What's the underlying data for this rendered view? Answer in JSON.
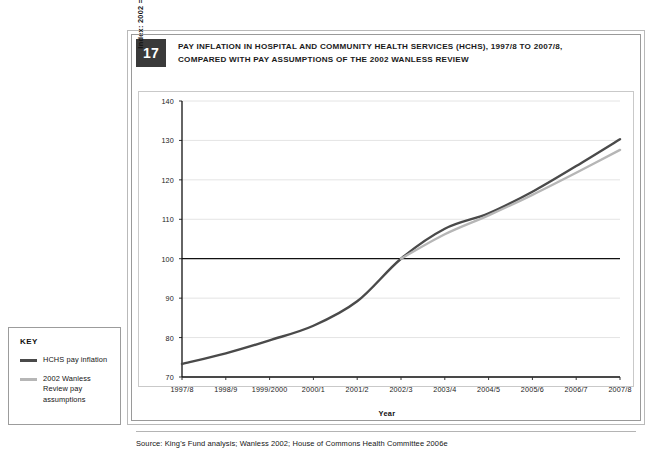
{
  "figure": {
    "number": "17",
    "title": "PAY INFLATION IN HOSPITAL AND COMMUNITY HEALTH SERVICES (HCHS), 1997/8 TO 2007/8, COMPARED WITH PAY ASSUMPTIONS OF THE 2002 WANLESS REVIEW",
    "source": "Source: King's Fund analysis; Wanless 2002; House of Commons Health Committee 2006e"
  },
  "key": {
    "heading": "KEY",
    "entries": [
      {
        "label": "HCHS pay inflation",
        "color": "#4a4a4a"
      },
      {
        "label": "2002 Wanless Review pay assumptions",
        "color": "#b6b6b6"
      }
    ]
  },
  "colors": {
    "series_hchs": "#4a4a4a",
    "series_wanless": "#b6b6b6",
    "gridline": "#e4e4e4",
    "baseline": "#111111",
    "frame": "#c9c9c9",
    "badge_bg": "#3a3a3a"
  },
  "chart_data": {
    "type": "line",
    "title": "PAY INFLATION IN HOSPITAL AND COMMUNITY HEALTH SERVICES (HCHS), 1997/8 TO 2007/8, COMPARED WITH PAY ASSUMPTIONS OF THE 2002 WANLESS REVIEW",
    "xlabel": "Year",
    "ylabel": "Index: 2002 = 100",
    "ylim": [
      70,
      140
    ],
    "yticks": [
      70,
      80,
      90,
      100,
      110,
      120,
      130,
      140
    ],
    "grid": true,
    "emphasized_gridline": 100,
    "legend_position": "outside-left",
    "categories": [
      "1997/8",
      "1998/9",
      "1999/2000",
      "2000/1",
      "2001/2",
      "2002/3",
      "2003/4",
      "2004/5",
      "2005/6",
      "2006/7",
      "2007/8"
    ],
    "series": [
      {
        "name": "HCHS pay inflation",
        "color": "#4a4a4a",
        "values": [
          73.3,
          76.0,
          79.3,
          83.0,
          89.2,
          100.0,
          107.6,
          111.5,
          117.0,
          123.5,
          130.3
        ]
      },
      {
        "name": "2002 Wanless Review pay assumptions",
        "color": "#b6b6b6",
        "values": [
          null,
          null,
          null,
          null,
          null,
          100.0,
          106.2,
          111.0,
          116.2,
          121.8,
          127.6
        ]
      }
    ]
  }
}
